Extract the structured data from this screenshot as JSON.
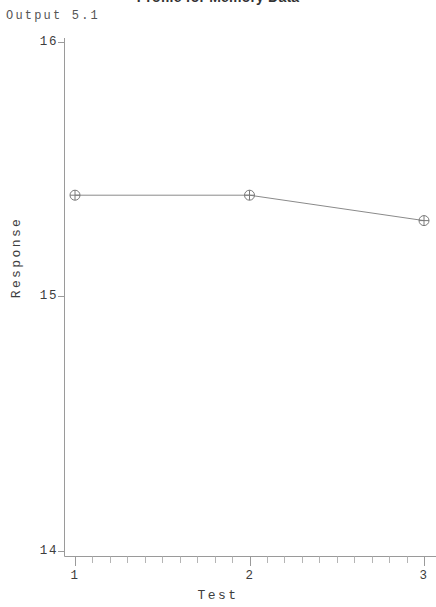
{
  "figure": {
    "output_label": "Output 5.1",
    "title": "Profile for Memory Data",
    "background_color": "#ffffff",
    "axis_color": "#9a9a9a",
    "line_color": "#8a8a8a",
    "marker_color": "#7a7a7a",
    "text_color": "#3d3d3d"
  },
  "chart_data": {
    "type": "line",
    "title": "Profile for Memory Data",
    "xlabel": "Test",
    "ylabel": "Response",
    "x": [
      1,
      2,
      3
    ],
    "values": [
      15.4,
      15.4,
      15.3
    ],
    "series": [
      {
        "name": "Memory",
        "values": [
          15.4,
          15.4,
          15.3
        ],
        "marker": "circle-plus"
      }
    ],
    "xtick_labels": [
      "1",
      "2",
      "3"
    ],
    "xtick_values": [
      1,
      2,
      3
    ],
    "ytick_labels": [
      "16",
      "15",
      "14"
    ],
    "ytick_values": [
      16,
      15,
      14
    ],
    "xlim": [
      1,
      3
    ],
    "ylim": [
      14,
      16
    ],
    "x_minor_ticks_between": 9,
    "grid": false,
    "legend": null
  }
}
